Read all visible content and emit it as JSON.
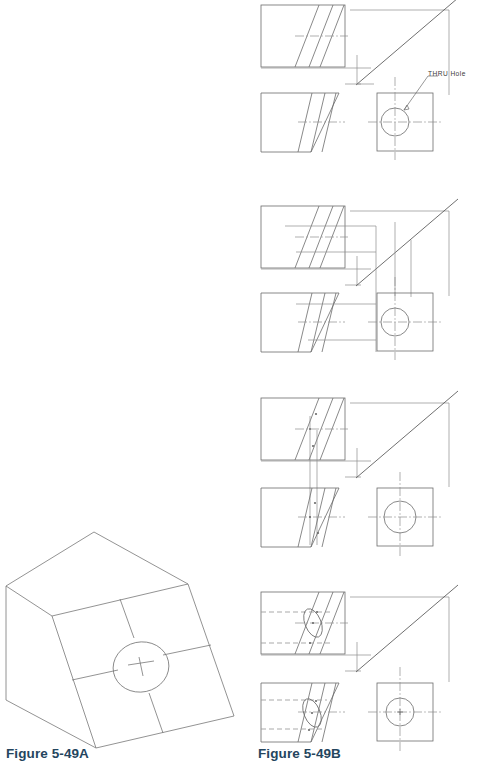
{
  "page": {
    "background": "#ffffff",
    "width": 495,
    "height": 768
  },
  "captions": [
    {
      "id": "caption-a",
      "label": "Figure 5-49A",
      "color": "#24455e",
      "x": 6,
      "y": 746
    },
    {
      "id": "caption-b",
      "label": "Figure 5-49B",
      "color": "#24455e",
      "x": 258,
      "y": 746
    }
  ],
  "annotations": [
    {
      "id": "thru-hole",
      "label": "THRU  Hole",
      "x": 428,
      "y": 70,
      "color": "#3a3a3a"
    }
  ],
  "colors": {
    "object_line": "#6b6b6b",
    "projection_line": "#8d8d8d",
    "hidden_line": "#9a9a9a",
    "center_line": "#8d8d8d",
    "caption_text": "#24455e",
    "annotation_text": "#3a3a3a",
    "background": "#ffffff"
  },
  "figures": {
    "figure_a": {
      "name": "Figure 5-49A",
      "description": "Isometric pictorial of an inclined-face block with a through hole",
      "type": "isometric-pictorial",
      "features": [
        "inclined face",
        "through hole",
        "center cross"
      ]
    },
    "figure_b": {
      "name": "Figure 5-49B",
      "description": "Four-step orthographic projection construction sequence",
      "type": "orthographic-steps",
      "steps": [
        {
          "step": 1,
          "label": "Step 1",
          "shows": "top view, front view, side view with THRU Hole and miter line"
        },
        {
          "step": 2,
          "label": "Step 2",
          "shows": "projection lines carried from side view to top and front views"
        },
        {
          "step": 3,
          "label": "Step 3",
          "shows": "vertical projectors located on the inclined surface"
        },
        {
          "step": 4,
          "label": "Step 4",
          "shows": "completed views with hidden lines and elliptical hole"
        }
      ]
    }
  },
  "views": {
    "top_view": "top",
    "front_view": "front",
    "side_view": "side",
    "hole_callout": "THRU  Hole"
  }
}
